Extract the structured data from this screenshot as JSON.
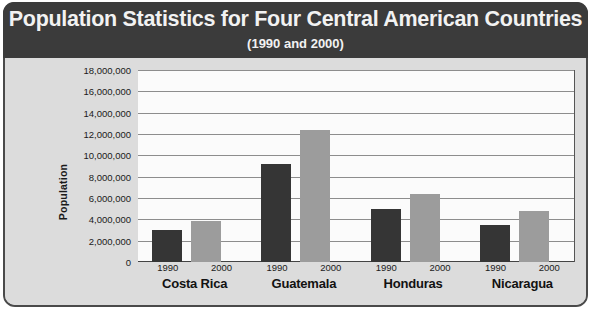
{
  "chart_data": {
    "type": "bar",
    "title": "Population Statistics for Four Central American Countries",
    "subtitle": "(1990 and 2000)",
    "xlabel": "",
    "ylabel": "Population",
    "ylim": [
      0,
      18000000
    ],
    "ytick_step": 2000000,
    "grid": true,
    "legend": "none",
    "categories": [
      "Costa Rica",
      "Guatemala",
      "Honduras",
      "Nicaragua"
    ],
    "ytick_labels": [
      "18,000,000",
      "16,000,000",
      "14,000,000",
      "12,000,000",
      "10,000,000",
      "8,000,000",
      "6,000,000",
      "4,000,000",
      "2,000,000",
      "0"
    ],
    "ytick_values": [
      18000000,
      16000000,
      14000000,
      12000000,
      10000000,
      8000000,
      6000000,
      4000000,
      2000000,
      0
    ],
    "series": [
      {
        "name": "1990",
        "color": "#353535",
        "values": [
          3000000,
          9200000,
          5000000,
          3500000
        ]
      },
      {
        "name": "2000",
        "color": "#9c9c9c",
        "values": [
          3800000,
          12400000,
          6400000,
          4800000
        ]
      }
    ],
    "groups": [
      {
        "category": "Costa Rica",
        "bars": [
          {
            "year": "1990",
            "value": 3000000
          },
          {
            "year": "2000",
            "value": 3800000
          }
        ]
      },
      {
        "category": "Guatemala",
        "bars": [
          {
            "year": "1990",
            "value": 9200000
          },
          {
            "year": "2000",
            "value": 12400000
          }
        ]
      },
      {
        "category": "Honduras",
        "bars": [
          {
            "year": "1990",
            "value": 5000000
          },
          {
            "year": "2000",
            "value": 6400000
          }
        ]
      },
      {
        "category": "Nicaragua",
        "bars": [
          {
            "year": "1990",
            "value": 3500000
          },
          {
            "year": "2000",
            "value": 4800000
          }
        ]
      }
    ]
  },
  "colors": {
    "title_bar": "#3b3b3b",
    "title_text": "#f2f2f2",
    "panel": "#dcdcdc",
    "plot_bg": "#fbfbfb",
    "gridline": "#8d8d8d",
    "bar_1990": "#353535",
    "bar_2000": "#9c9c9c",
    "frame_border": "#4a4a4a"
  }
}
